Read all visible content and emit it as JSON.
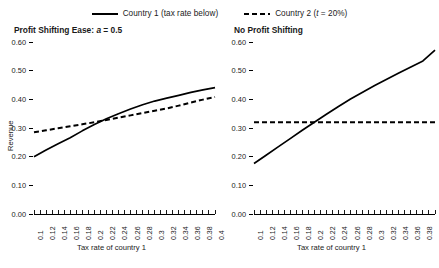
{
  "legend": {
    "entries": [
      {
        "label_pre": "Country 1 (tax rate below)",
        "style": "solid"
      },
      {
        "label_pre": "Country 2 (",
        "label_ital": "t",
        "label_post": " = 20%)",
        "style": "dashed"
      }
    ]
  },
  "chart_data": [
    {
      "type": "line",
      "panel": "left",
      "title_pre": "Profit Shifting Ease: ",
      "title_ital": "a",
      "title_post": " = 0.5",
      "title": "Profit Shifting Ease: a = 0.5",
      "xlabel": "Tax rate of country 1",
      "ylabel": "Revenue",
      "xlim": [
        0.1,
        0.4
      ],
      "ylim": [
        0.0,
        0.6
      ],
      "yticks": [
        "0.00",
        "0.10",
        "0.20",
        "0.30",
        "0.40",
        "0.50",
        "0.60"
      ],
      "ytick_values": [
        0.0,
        0.1,
        0.2,
        0.3,
        0.4,
        0.5,
        0.6
      ],
      "xticks": [
        "0.1",
        "0.12",
        "0.14",
        "0.16",
        "0.18",
        "0.2",
        "0.22",
        "0.24",
        "0.26",
        "0.28",
        "0.3",
        "0.32",
        "0.34",
        "0.36",
        "0.38",
        "0.4"
      ],
      "xtick_values": [
        0.1,
        0.12,
        0.14,
        0.16,
        0.18,
        0.2,
        0.22,
        0.24,
        0.26,
        0.28,
        0.3,
        0.32,
        0.34,
        0.36,
        0.38,
        0.4
      ],
      "minor_ticks": 31,
      "grid": false,
      "legend_position": "top-center",
      "x": [
        0.1,
        0.12,
        0.14,
        0.16,
        0.18,
        0.2,
        0.22,
        0.24,
        0.26,
        0.28,
        0.3,
        0.32,
        0.34,
        0.36,
        0.38,
        0.4
      ],
      "series": [
        {
          "name": "Country 1 (tax rate below)",
          "style": "solid",
          "values": [
            0.2,
            0.223,
            0.245,
            0.266,
            0.29,
            0.312,
            0.332,
            0.35,
            0.366,
            0.381,
            0.394,
            0.404,
            0.414,
            0.424,
            0.433,
            0.441
          ]
        },
        {
          "name": "Country 2 (t = 20%)",
          "style": "dashed",
          "values": [
            0.285,
            0.292,
            0.299,
            0.306,
            0.313,
            0.32,
            0.328,
            0.336,
            0.344,
            0.352,
            0.36,
            0.368,
            0.378,
            0.389,
            0.399,
            0.408
          ]
        }
      ]
    },
    {
      "type": "line",
      "panel": "right",
      "title_pre": "No Profit Shifting",
      "title_ital": "",
      "title_post": "",
      "title": "No Profit Shifting",
      "xlabel": "Tax rate of country 1",
      "ylabel": "",
      "xlim": [
        0.1,
        0.4
      ],
      "ylim": [
        0.0,
        0.6
      ],
      "yticks": [
        "0.00",
        "0.10",
        "0.20",
        "0.30",
        "0.40",
        "0.50",
        "0.60"
      ],
      "ytick_values": [
        0.0,
        0.1,
        0.2,
        0.3,
        0.4,
        0.5,
        0.6
      ],
      "xticks": [
        "0.1",
        "0.12",
        "0.14",
        "0.16",
        "0.18",
        "0.2",
        "0.22",
        "0.24",
        "0.26",
        "0.28",
        "0.3",
        "0.32",
        "0.34",
        "0.36",
        "0.38"
      ],
      "xtick_values": [
        0.1,
        0.12,
        0.14,
        0.16,
        0.18,
        0.2,
        0.22,
        0.24,
        0.26,
        0.28,
        0.3,
        0.32,
        0.34,
        0.36,
        0.38
      ],
      "minor_ticks": 31,
      "grid": false,
      "legend_position": "top-center",
      "x": [
        0.1,
        0.12,
        0.14,
        0.16,
        0.18,
        0.2,
        0.22,
        0.24,
        0.26,
        0.28,
        0.3,
        0.32,
        0.34,
        0.36,
        0.38,
        0.4
      ],
      "series": [
        {
          "name": "Country 1 (tax rate below)",
          "style": "solid",
          "values": [
            0.176,
            0.205,
            0.234,
            0.263,
            0.292,
            0.32,
            0.348,
            0.375,
            0.401,
            0.425,
            0.448,
            0.47,
            0.492,
            0.513,
            0.534,
            0.572
          ]
        },
        {
          "name": "Country 2 (t = 20%)",
          "style": "dashed",
          "values": [
            0.32,
            0.32,
            0.32,
            0.32,
            0.32,
            0.32,
            0.32,
            0.32,
            0.32,
            0.32,
            0.32,
            0.32,
            0.32,
            0.32,
            0.32,
            0.32
          ]
        }
      ]
    }
  ],
  "colors": {
    "line": "#000000",
    "text": "#1a1a1a",
    "background": "#ffffff"
  }
}
